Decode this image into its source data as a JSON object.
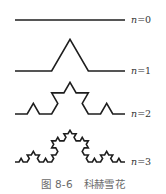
{
  "figure": {
    "caption": "图 8-6   科赫雪花",
    "stroke_color": "#1e1e1e",
    "label_color": "#333333",
    "caption_color": "#6a6a6a",
    "x_start": 15,
    "x_end": 125,
    "levels": [
      {
        "n": 0,
        "label_var": "n",
        "label_eq": "=0",
        "baseline_y": 20,
        "label_x": 131,
        "label_y": 15
      },
      {
        "n": 1,
        "label_var": "n",
        "label_eq": "=1",
        "baseline_y": 71,
        "label_x": 131,
        "label_y": 66
      },
      {
        "n": 2,
        "label_var": "n",
        "label_eq": "=2",
        "baseline_y": 114,
        "label_x": 131,
        "label_y": 109
      },
      {
        "n": 3,
        "label_var": "n",
        "label_eq": "=3",
        "baseline_y": 162,
        "label_x": 131,
        "label_y": 157
      }
    ]
  }
}
